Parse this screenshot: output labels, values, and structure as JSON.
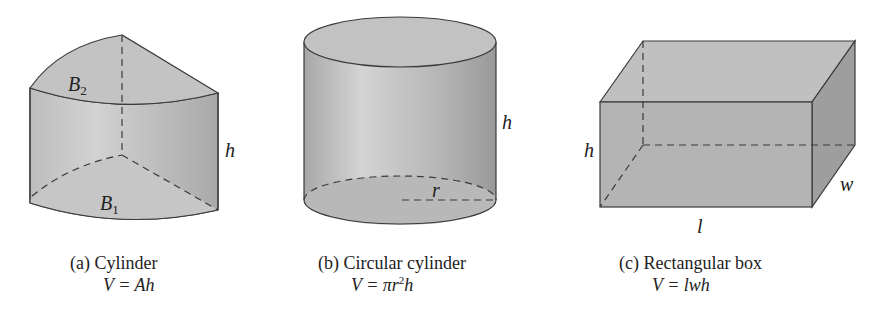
{
  "figures": [
    {
      "id": "a",
      "caption": "(a) Cylinder",
      "formula_prefix": "V = ",
      "formula_body": "Ah",
      "labels": {
        "top_base": "B",
        "top_base_sub": "2",
        "bottom_base": "B",
        "bottom_base_sub": "1",
        "height": "h"
      }
    },
    {
      "id": "b",
      "caption": "(b) Circular cylinder",
      "formula_prefix": "V = πr",
      "formula_exp": "2",
      "formula_suffix": "h",
      "labels": {
        "radius": "r",
        "height": "h"
      }
    },
    {
      "id": "c",
      "caption": "(c) Rectangular box",
      "formula_prefix": "V = ",
      "formula_body": "lwh",
      "labels": {
        "height": "h",
        "width": "w",
        "length": "l"
      }
    }
  ],
  "colors": {
    "stroke": "#3a3a3a",
    "fill_light": "#c8c8c8",
    "fill_mid": "#b0b0b0",
    "fill_dark": "#999999"
  }
}
